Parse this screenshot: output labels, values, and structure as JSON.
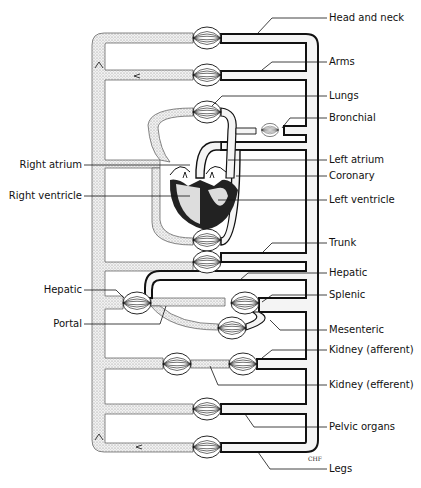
{
  "figure": {
    "signature": "CHF"
  },
  "labels_right": [
    {
      "id": "head-and-neck",
      "text": "Head and neck",
      "y": 18
    },
    {
      "id": "arms",
      "text": "Arms",
      "y": 62
    },
    {
      "id": "lungs",
      "text": "Lungs",
      "y": 96
    },
    {
      "id": "bronchial",
      "text": "Bronchial",
      "y": 118
    },
    {
      "id": "left-atrium",
      "text": "Left atrium",
      "y": 160
    },
    {
      "id": "coronary",
      "text": "Coronary",
      "y": 176
    },
    {
      "id": "left-ventricle",
      "text": "Left ventricle",
      "y": 200
    },
    {
      "id": "trunk",
      "text": "Trunk",
      "y": 243
    },
    {
      "id": "hepatic-right",
      "text": "Hepatic",
      "y": 273
    },
    {
      "id": "splenic",
      "text": "Splenic",
      "y": 295
    },
    {
      "id": "mesenteric",
      "text": "Mesenteric",
      "y": 330
    },
    {
      "id": "kidney-afferent",
      "text": "Kidney (afferent)",
      "y": 350
    },
    {
      "id": "kidney-efferent",
      "text": "Kidney (efferent)",
      "y": 385
    },
    {
      "id": "pelvic-organs",
      "text": "Pelvic organs",
      "y": 427
    },
    {
      "id": "legs",
      "text": "Legs",
      "y": 469
    }
  ],
  "labels_left": [
    {
      "id": "right-atrium",
      "text": "Right atrium",
      "y": 165
    },
    {
      "id": "right-ventricle",
      "text": "Right ventricle",
      "y": 196
    },
    {
      "id": "hepatic-left",
      "text": "Hepatic",
      "y": 290
    },
    {
      "id": "portal",
      "text": "Portal",
      "y": 324
    }
  ],
  "colors": {
    "ink": "#111111",
    "vein_fill": "#e6e6e6",
    "background": "#ffffff"
  }
}
